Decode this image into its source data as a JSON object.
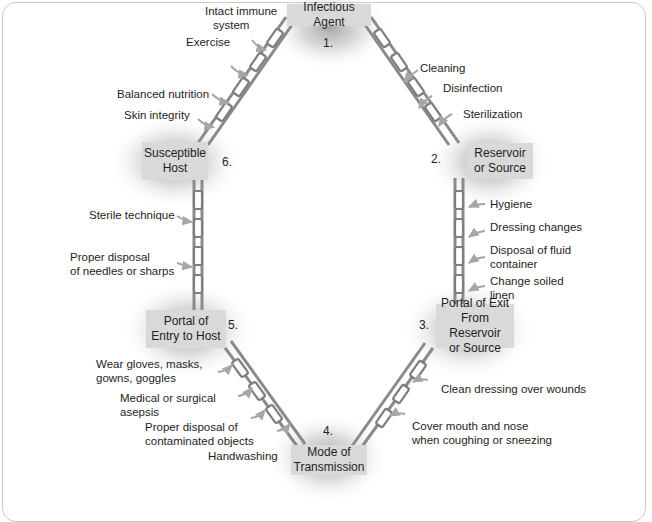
{
  "diagram": {
    "colors": {
      "box_fill": "#d9d9d9",
      "chain": "#8a8a8a",
      "glow": "#9a9a9a",
      "arrow": "#a8a8a8",
      "frame": "#c9c9c9"
    },
    "nodes": [
      {
        "number": "1.",
        "label": "Infectious Agent"
      },
      {
        "number": "2.",
        "label_line1": "Reservoir",
        "label_line2": "or Source"
      },
      {
        "number": "3.",
        "label_line1": "Portal of Exit",
        "label_line2": "From Reservoir",
        "label_line3": "or Source"
      },
      {
        "number": "4.",
        "label_line1": "Mode of",
        "label_line2": "Transmission"
      },
      {
        "number": "5.",
        "label_line1": "Portal of",
        "label_line2": "Entry to Host"
      },
      {
        "number": "6.",
        "label_line1": "Susceptible",
        "label_line2": "Host"
      }
    ],
    "interventions": {
      "agent_to_reservoir": [
        {
          "text": "Cleaning"
        },
        {
          "text": "Disinfection"
        },
        {
          "text": "Sterilization"
        }
      ],
      "reservoir_to_exit": [
        {
          "text": "Hygiene"
        },
        {
          "text": "Dressing changes"
        },
        {
          "line1": "Disposal of fluid",
          "line2": "container"
        },
        {
          "line1": "Change soiled",
          "line2": "linen"
        }
      ],
      "exit_to_transmission": [
        {
          "text": "Clean dressing over wounds"
        },
        {
          "line1": "Cover mouth and nose",
          "line2": "when coughing or sneezing"
        }
      ],
      "transmission_to_entry": [
        {
          "line1": "Wear gloves, masks,",
          "line2": "gowns, goggles"
        },
        {
          "line1": "Medical or surgical",
          "line2": "asepsis"
        },
        {
          "line1": "Proper disposal of",
          "line2": "contaminated objects"
        },
        {
          "text": "Handwashing"
        }
      ],
      "entry_to_host": [
        {
          "text": "Sterile technique"
        },
        {
          "line1": "Proper disposal",
          "line2": "of needles or sharps"
        }
      ],
      "host_to_agent": [
        {
          "line1": "Intact immune",
          "line2": "system"
        },
        {
          "text": "Exercise"
        },
        {
          "text": "Balanced nutrition"
        },
        {
          "text": "Skin integrity"
        }
      ]
    }
  }
}
